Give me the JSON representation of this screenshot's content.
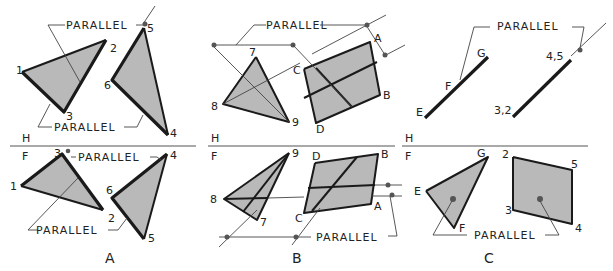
{
  "figure": {
    "annotation": "PARALLEL",
    "fold_labels": {
      "top": "H",
      "bottom": "F"
    },
    "colors": {
      "plane_fill": "#b9b9b9",
      "edge": "#1a1a1a",
      "construction": "#444444",
      "point": "#555555"
    },
    "panels": [
      {
        "caption": "A",
        "top_view_points": [
          "1",
          "2",
          "3",
          "5",
          "6",
          "4"
        ],
        "front_view_points": [
          "3",
          "1",
          "2",
          "6",
          "4",
          "5"
        ],
        "parallel_callouts": 4
      },
      {
        "caption": "B",
        "top_view_points": [
          "7",
          "8",
          "9",
          "A",
          "B",
          "C",
          "D"
        ],
        "front_view_points": [
          "9",
          "8",
          "7",
          "D",
          "B",
          "C",
          "A"
        ],
        "parallel_callouts": 2
      },
      {
        "caption": "C",
        "top_view_points": [
          "E",
          "F",
          "G",
          "4,5",
          "3,2"
        ],
        "front_view_points": [
          "G",
          "E",
          "F",
          "2",
          "5",
          "3",
          "4"
        ],
        "parallel_callouts": 2
      }
    ]
  }
}
